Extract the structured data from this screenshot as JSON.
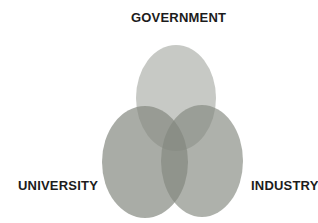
{
  "diagram": {
    "type": "venn",
    "sets": [
      {
        "id": "government",
        "label": "GOVERNMENT",
        "position": "top"
      },
      {
        "id": "university",
        "label": "UNIVERSITY",
        "position": "bottom-left"
      },
      {
        "id": "industry",
        "label": "INDUSTRY",
        "position": "bottom-right"
      }
    ],
    "colors": {
      "background": "#ffffff",
      "ellipse_base": "#82877e",
      "label_text": "#1c1c1c"
    }
  }
}
